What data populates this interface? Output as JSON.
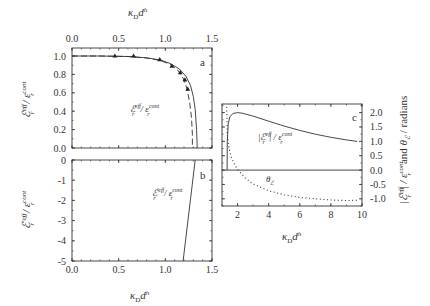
{
  "chart_data": [
    {
      "id": "a",
      "type": "line",
      "panel_label": "a",
      "title": "",
      "xlabel": "κ_D d^h",
      "xlabel_position": "top",
      "ylabel": "ε_r^eff / ε_r^cont",
      "xlim": [
        0.0,
        1.5
      ],
      "ylim": [
        0.0,
        1.0
      ],
      "x_ticks": [
        "0.0",
        "0.5",
        "1.0",
        "1.5"
      ],
      "y_ticks": [
        "0.0",
        "0.2",
        "0.4",
        "0.6",
        "0.8",
        "1.0"
      ],
      "grid": false,
      "annotation": "ε_r^eff / ε_r^cont",
      "series": [
        {
          "name": "theory (solid)",
          "style": "solid",
          "x": [
            0.0,
            0.3,
            0.6,
            0.8,
            0.95,
            1.05,
            1.15,
            1.22,
            1.27,
            1.3,
            1.32,
            1.335,
            1.34,
            1.34
          ],
          "y": [
            1.0,
            1.0,
            0.995,
            0.98,
            0.955,
            0.92,
            0.86,
            0.78,
            0.68,
            0.56,
            0.42,
            0.2,
            0.05,
            0.0
          ]
        },
        {
          "name": "theory (dashed)",
          "style": "dashed",
          "x": [
            0.0,
            0.3,
            0.6,
            0.8,
            0.95,
            1.05,
            1.13,
            1.19,
            1.23,
            1.26,
            1.28,
            1.29,
            1.29
          ],
          "y": [
            1.0,
            1.0,
            0.995,
            0.978,
            0.95,
            0.91,
            0.85,
            0.76,
            0.65,
            0.5,
            0.33,
            0.15,
            0.0
          ]
        },
        {
          "name": "data (triangles)",
          "style": "markers",
          "marker": "triangle",
          "x": [
            0.46,
            0.66,
            0.94,
            1.07,
            1.16,
            1.21,
            1.24
          ],
          "y": [
            1.0,
            1.0,
            0.96,
            0.89,
            0.82,
            0.74,
            0.64
          ]
        }
      ]
    },
    {
      "id": "b",
      "type": "line",
      "panel_label": "b",
      "title": "",
      "xlabel": "κ_D d^h",
      "ylabel": "ε_r^'eff / ε_r^cont",
      "xlim": [
        0.0,
        1.5
      ],
      "ylim": [
        -5,
        0
      ],
      "x_ticks": [
        "0.0",
        "0.5",
        "1.0",
        "1.5"
      ],
      "y_ticks": [
        "0",
        "-1",
        "-2",
        "-3",
        "-4",
        "-5"
      ],
      "grid": false,
      "annotation": "ε_r^'eff / ε_r^cont",
      "series": [
        {
          "name": "ε'_r^eff / ε_r^cont",
          "style": "solid",
          "x": [
            1.32,
            1.19
          ],
          "y": [
            0,
            -5
          ]
        }
      ]
    },
    {
      "id": "c",
      "type": "line",
      "panel_label": "c",
      "title": "",
      "xlabel": "κ_D d^h",
      "ylabel": "|ε_r^eff| / ε_r^cont  and  θ_ε / radians",
      "ylabel_position": "right",
      "xlim": [
        1,
        10
      ],
      "ylim": [
        -1.25,
        2.3
      ],
      "x_ticks": [
        "2",
        "4",
        "6",
        "8",
        "10"
      ],
      "y_ticks": [
        "-1.0",
        "-0.5",
        "0.0",
        "0.5",
        "1.0",
        "1.5",
        "2.0"
      ],
      "grid": false,
      "annotations": [
        "|ε_r^eff| / ε_r^cont",
        "θ_ε"
      ],
      "series": [
        {
          "name": "|ε_r^eff| / ε_r^cont",
          "style": "solid",
          "x": [
            1.33,
            1.34,
            1.4,
            1.5,
            1.7,
            2.0,
            2.3,
            3.0,
            4.0,
            5.0,
            6.0,
            7.0,
            8.0,
            9.0,
            9.7
          ],
          "y": [
            0.0,
            1.0,
            1.6,
            1.85,
            1.97,
            2.0,
            1.98,
            1.88,
            1.7,
            1.53,
            1.38,
            1.25,
            1.14,
            1.05,
            1.0
          ]
        },
        {
          "name": "θ_ε",
          "style": "dotted",
          "x": [
            1.3,
            1.35,
            1.45,
            1.6,
            1.8,
            2.0,
            2.5,
            3.0,
            4.0,
            5.0,
            6.0,
            7.0,
            8.0,
            9.0,
            9.7
          ],
          "y": [
            2.2,
            1.2,
            0.75,
            0.45,
            0.2,
            0.02,
            -0.28,
            -0.48,
            -0.72,
            -0.86,
            -0.95,
            -1.0,
            -1.04,
            -1.06,
            -1.05
          ]
        },
        {
          "name": "zero line",
          "style": "solid",
          "x": [
            1,
            10
          ],
          "y": [
            0,
            0
          ]
        }
      ]
    }
  ],
  "labels": {
    "a_top_xlabel_main": "κ",
    "a_top_xlabel_sub": "D",
    "a_top_xlabel_d": "d",
    "a_top_xlabel_sup": "h",
    "a_ylabel": "ℰr eff / εr cont",
    "b_ylabel": "ℰ'r eff / εr cont",
    "b_xlabel": "κD dh",
    "c_xlabel": "κD dh",
    "c_ylabel": "|ℰr eff| / εr cont  and  θℰ / radians",
    "annot_a": "ℰr eff / εr cont",
    "annot_b": "ℰ'r eff / εr cont",
    "annot_c_mod": "|ℰr eff| / εr cont",
    "annot_c_theta": "θℰ"
  }
}
